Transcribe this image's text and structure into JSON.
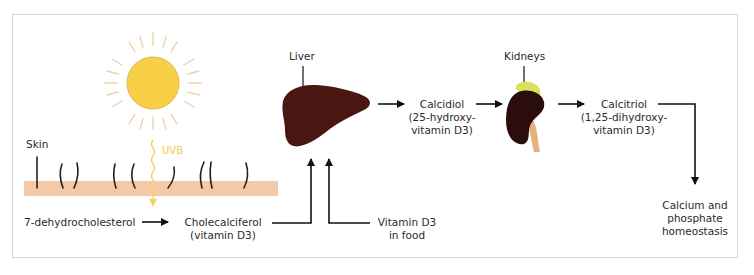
{
  "diagram": {
    "colors": {
      "sun_fill": "#f7d046",
      "sun_rays": "#e8d2b0",
      "uvb": "#f2d36a",
      "skin": "#f4c9a8",
      "hair": "#222222",
      "liver": "#4a1612",
      "kidney": "#2b0d0d",
      "adrenal": "#d9e35a",
      "ureter": "#e3b27e",
      "arrow": "#111111",
      "frame": "#d6d6d6"
    },
    "labels": {
      "skin": "Skin",
      "uvb": "UVB",
      "liver": "Liver",
      "kidneys": "Kidneys"
    },
    "nodes": {
      "precursor": {
        "line1": "7-dehydrocholesterol"
      },
      "cholecalciferol": {
        "line1": "Cholecalciferol",
        "line2": "(vitamin D3)"
      },
      "food": {
        "line1": "Vitamin D3",
        "line2": "in food"
      },
      "calcidiol": {
        "line1": "Calcidiol",
        "line2": "(25-hydroxy-",
        "line3": "vitamin D3)"
      },
      "calcitriol": {
        "line1": "Calcitriol",
        "line2": "(1,25-dihydroxy-",
        "line3": "vitamin D3)"
      },
      "outcome": {
        "line1": "Calcium and",
        "line2": "phosphate",
        "line3": "homeostasis"
      }
    },
    "icons": [
      "sun-icon",
      "skin-layer-icon",
      "liver-icon",
      "kidney-icon",
      "arrow-icon"
    ]
  }
}
